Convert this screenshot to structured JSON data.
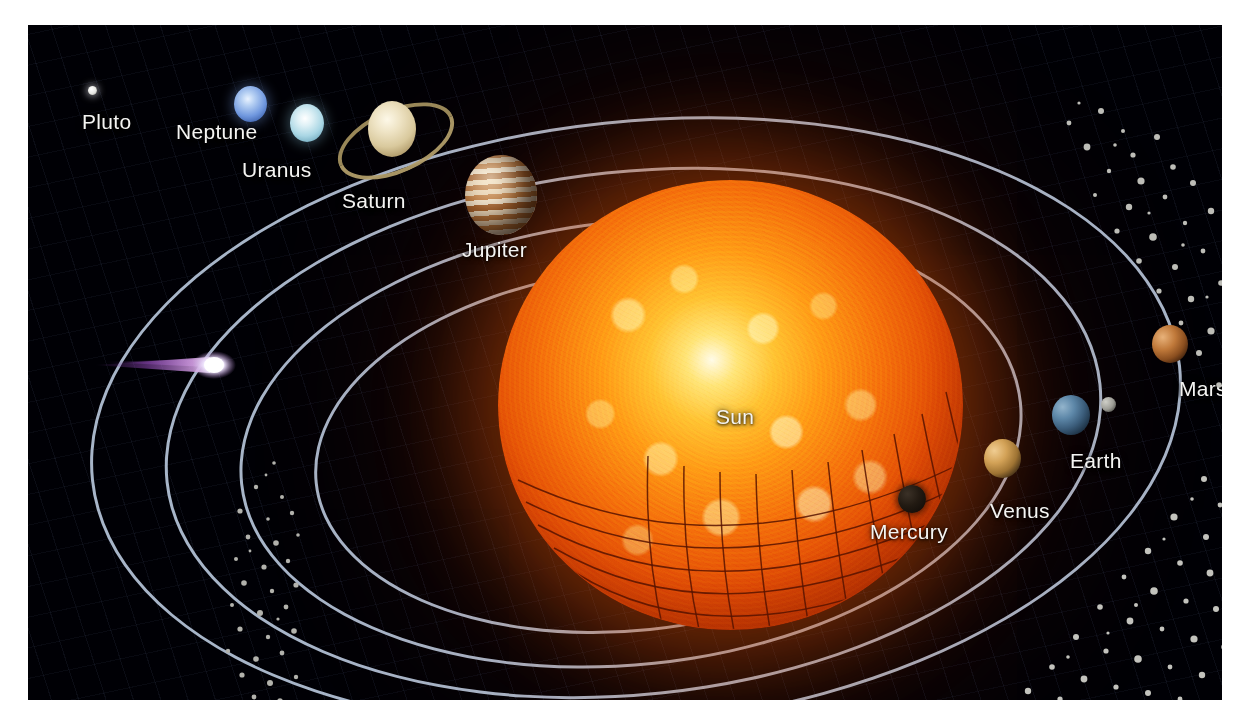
{
  "figure": {
    "kind": "solar-system-illustration",
    "background_color": "#000005",
    "frame_color": "#ffffff",
    "orbit_line_color": "#b9c9de",
    "outer_orbit_line_color": "#8fa2c4",
    "label_color": "#f4f4f2"
  },
  "star": {
    "name": "Sun",
    "label": "Sun",
    "core_color": "#fffbe8",
    "mid_color": "#ff9a16",
    "edge_color": "#7d1a01",
    "grid_color": "#5a1400"
  },
  "bodies": [
    {
      "id": "pluto",
      "label": "Pluto",
      "color": "#e8e8e4",
      "shadow": false
    },
    {
      "id": "neptune",
      "label": "Neptune",
      "color": "#7f9fe0",
      "shadow": false
    },
    {
      "id": "uranus",
      "label": "Uranus",
      "color": "#bcddea",
      "shadow": false
    },
    {
      "id": "saturn",
      "label": "Saturn",
      "color": "#ddd2b0",
      "ring_color": "#9c8a5e",
      "shadow": false
    },
    {
      "id": "jupiter",
      "label": "Jupiter",
      "color": "#c98a4e",
      "band_color": "#f0ddc4",
      "shadow": false
    },
    {
      "id": "mars",
      "label": "Mars",
      "color": "#a8682c",
      "shadow": true
    },
    {
      "id": "earth",
      "label": "Earth",
      "color": "#4a6a88",
      "shadow": true,
      "moon": true
    },
    {
      "id": "venus",
      "label": "Venus",
      "color": "#c9954a",
      "shadow": true
    },
    {
      "id": "mercury",
      "label": "Mercury",
      "color": "#1a1410",
      "shadow": true
    }
  ],
  "features": {
    "comet": {
      "name": "comet",
      "head_color": "#ffffff",
      "tail_color": "#a05ec0"
    },
    "moon": {
      "name": "moon",
      "color": "#9a9a94"
    },
    "asteroid_belt": {
      "name": "asteroid-belt",
      "color": "#b9b9b4"
    },
    "saturn_rings": {
      "name": "saturn-rings"
    }
  }
}
